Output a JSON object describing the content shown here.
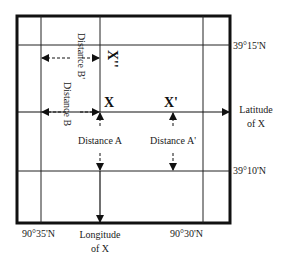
{
  "diagram": {
    "points": {
      "x": "X",
      "x_prime": "X'",
      "x_double_prime": "X''"
    },
    "distances": {
      "a": "Distance A",
      "a_prime": "Distance A'",
      "b": "Distance B",
      "b_prime": "Distance B'"
    },
    "axes": {
      "latitude_line1": "Latitude",
      "latitude_line2": "of X",
      "longitude_line1": "Longitude",
      "longitude_line2": "of X"
    },
    "grid_labels": {
      "lat_top": "39°15'N",
      "lat_bottom": "39°10'N",
      "lon_left": "90°35'N",
      "lon_right": "90°30'N"
    },
    "colors": {
      "line": "#111111",
      "background": "#ffffff"
    }
  }
}
